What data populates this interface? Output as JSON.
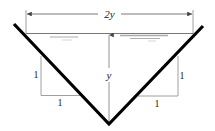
{
  "diagram": {
    "labels": {
      "top_width": "2y",
      "depth": "y",
      "left_slope_vertical": "1",
      "left_slope_horizontal": "1",
      "right_slope_vertical": "1",
      "right_slope_horizontal": "1"
    },
    "colors": {
      "channel_wall": "#000000",
      "dimension_line": "#777777",
      "water_surface": "#888888",
      "background": "#ffffff"
    }
  }
}
